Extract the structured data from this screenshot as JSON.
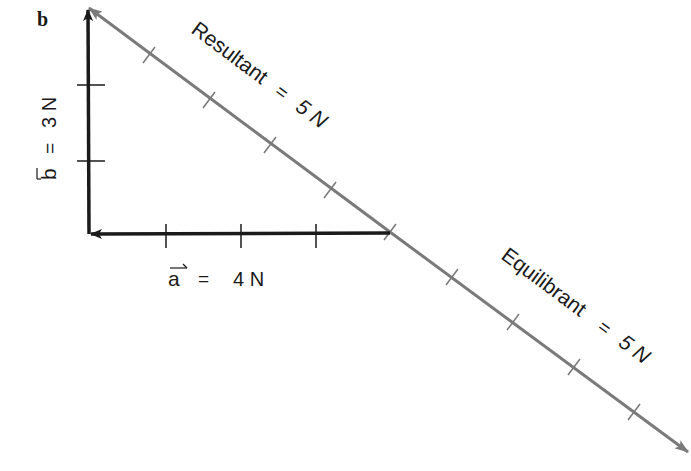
{
  "panel_label": "b",
  "vectors": {
    "a": {
      "symbol": "a",
      "equals": "=",
      "value": "4 N",
      "units_ticks": 4,
      "color": "#1a1a1a"
    },
    "b": {
      "symbol": "b",
      "equals": "=",
      "value": "3 N",
      "units_ticks": 3,
      "color": "#1a1a1a"
    },
    "resultant": {
      "label": "Resultant",
      "equals": "=",
      "value": "5 N",
      "units_ticks": 5,
      "color": "#7a7a7a"
    },
    "equilibrant": {
      "label": "Equilibrant",
      "equals": "=",
      "value": "5 N",
      "units_ticks": 5,
      "color": "#7a7a7a"
    }
  }
}
